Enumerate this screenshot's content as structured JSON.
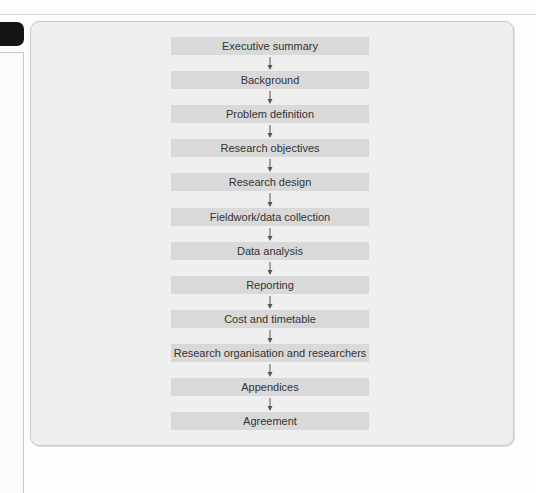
{
  "diagram": {
    "type": "flowchart",
    "direction": "top-to-bottom",
    "steps": [
      {
        "label": "Executive summary"
      },
      {
        "label": "Background"
      },
      {
        "label": "Problem definition"
      },
      {
        "label": "Research objectives"
      },
      {
        "label": "Research design"
      },
      {
        "label": "Fieldwork/data collection"
      },
      {
        "label": "Data analysis"
      },
      {
        "label": "Reporting"
      },
      {
        "label": "Cost and timetable"
      },
      {
        "label": "Research organisation and researchers"
      },
      {
        "label": "Appendices"
      },
      {
        "label": "Agreement"
      }
    ],
    "connector_icon": "down-arrow",
    "colors": {
      "box_fill": "#d9d9d9",
      "frame_fill": "#efefef",
      "text": "#333333",
      "arrow": "#555555",
      "side_tab": "#141414"
    }
  }
}
